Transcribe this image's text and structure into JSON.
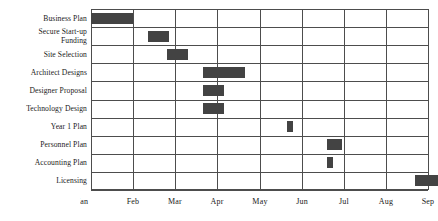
{
  "chart_data": {
    "type": "bar",
    "chart_subtype": "gantt",
    "title": "",
    "xlabel": "",
    "ylabel": "",
    "grid": true,
    "legend": "none",
    "x_axis": {
      "tick_labels": [
        "Jan",
        "Feb",
        "Mar",
        "Apr",
        "May",
        "Jun",
        "Jul",
        "Aug",
        "Sep"
      ],
      "tick_values": [
        1,
        2,
        3,
        4,
        5,
        6,
        7,
        8,
        9
      ],
      "xlim": [
        1,
        9
      ],
      "first_label_clipped": true
    },
    "categories": [
      "Business Plan",
      "Secure Start-up Funding",
      "Site Selection",
      "Architect Designs",
      "Designer Proposal",
      "Technology Design",
      "Year 1 Plan",
      "Personnel Plan",
      "Accounting Plan",
      "Licensing"
    ],
    "tasks": [
      {
        "name": "Business Plan",
        "label": "Business Plan",
        "start": 1.0,
        "end": 2.0,
        "duration": 1.0
      },
      {
        "name": "Secure Start-up Funding",
        "label": "Secure Start-up\nFunding",
        "start": 2.35,
        "end": 2.85,
        "duration": 0.5
      },
      {
        "name": "Site Selection",
        "label": "Site Selection",
        "start": 2.8,
        "end": 3.3,
        "duration": 0.5
      },
      {
        "name": "Architect Designs",
        "label": "Architect Designs",
        "start": 3.65,
        "end": 4.65,
        "duration": 1.0
      },
      {
        "name": "Designer Proposal",
        "label": "Designer Proposal",
        "start": 3.65,
        "end": 4.15,
        "duration": 0.5
      },
      {
        "name": "Technology Design",
        "label": "Technology Design",
        "start": 3.65,
        "end": 4.15,
        "duration": 0.5
      },
      {
        "name": "Year 1 Plan",
        "label": "Year 1 Plan",
        "start": 5.65,
        "end": 5.8,
        "duration": 0.15
      },
      {
        "name": "Personnel Plan",
        "label": "Personnel Plan",
        "start": 6.6,
        "end": 6.95,
        "duration": 0.35
      },
      {
        "name": "Accounting Plan",
        "label": "Accounting Plan",
        "start": 6.6,
        "end": 6.75,
        "duration": 0.15
      },
      {
        "name": "Licensing",
        "label": "Licensing",
        "start": 8.7,
        "end": 9.25,
        "duration": 0.55
      }
    ],
    "bar_color": "#434343",
    "grid_color": "#4d4d4d",
    "background": "#ffffff"
  }
}
